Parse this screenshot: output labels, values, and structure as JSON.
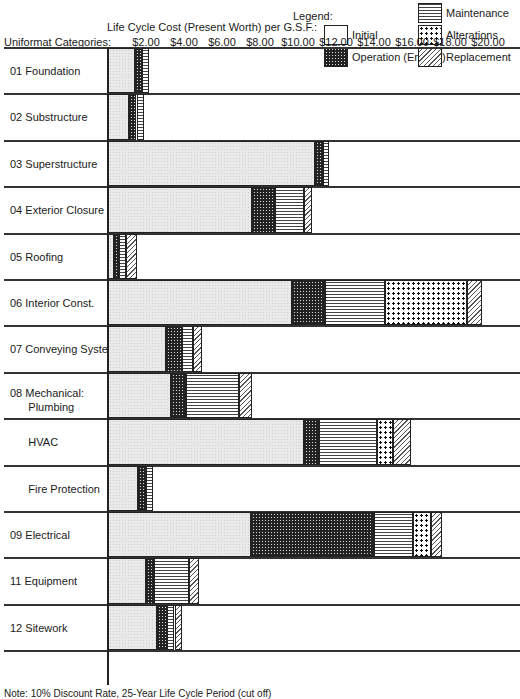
{
  "legend": {
    "title": "Legend:",
    "items": [
      {
        "key": "initial",
        "label": "Initial"
      },
      {
        "key": "operation",
        "label": "Operation (Energy)"
      },
      {
        "key": "maintenance",
        "label": "Maintenance"
      },
      {
        "key": "alterations",
        "label": "Alterations"
      },
      {
        "key": "replacement",
        "label": "Replacement"
      }
    ]
  },
  "axis": {
    "title": "Life Cycle Cost (Present Worth) per G.S.F.:",
    "category_header": "Uniformat Categories:",
    "ticks": [
      "$2.00",
      "$4.00",
      "$6.00",
      "$8.00",
      "$10.00",
      "$12.00",
      "$14.00",
      "$16.00",
      "$18.00",
      "$20.00"
    ]
  },
  "rows": [
    {
      "code": "01",
      "name": "Foundation"
    },
    {
      "code": "02",
      "name": "Substructure"
    },
    {
      "code": "03",
      "name": "Superstructure"
    },
    {
      "code": "04",
      "name": "Exterior Closure"
    },
    {
      "code": "05",
      "name": "Roofing"
    },
    {
      "code": "06",
      "name": "Interior Const."
    },
    {
      "code": "07",
      "name": "Conveying System"
    },
    {
      "code": "08",
      "name": "Mechanical:",
      "sub": "Plumbing"
    },
    {
      "code": "",
      "name": "HVAC"
    },
    {
      "code": "",
      "name": "Fire Protection"
    },
    {
      "code": "09",
      "name": "Electrical"
    },
    {
      "code": "11",
      "name": "Equipment"
    },
    {
      "code": "12",
      "name": "Sitework"
    }
  ],
  "footnote": "Note: 10% Discount Rate, 25-Year Life Cycle Period (cut off)",
  "chart_data": {
    "type": "bar",
    "orientation": "horizontal",
    "stacked": true,
    "title": "Life Cycle Cost (Present Worth) per G.S.F.",
    "xlabel": "Life Cycle Cost (Present Worth) per G.S.F.",
    "ylabel": "Uniformat Categories",
    "xlim": [
      0,
      20.5
    ],
    "x_ticks": [
      2,
      4,
      6,
      8,
      10,
      12,
      14,
      16,
      18,
      20
    ],
    "grid": false,
    "legend_position": "top-right",
    "categories": [
      "01 Foundation",
      "02 Substructure",
      "03 Superstructure",
      "04 Exterior Closure",
      "05 Roofing",
      "06 Interior Const.",
      "07 Conveying System",
      "08 Mechanical: Plumbing",
      "HVAC",
      "Fire Protection",
      "09 Electrical",
      "11 Equipment",
      "12 Sitework"
    ],
    "series": [
      {
        "name": "Initial",
        "values": [
          1.4,
          1.1,
          10.9,
          7.6,
          0.3,
          9.7,
          3.05,
          3.3,
          10.3,
          1.6,
          7.5,
          2.0,
          2.6
        ]
      },
      {
        "name": "Operation (Energy)",
        "values": [
          0.4,
          0.4,
          0.4,
          1.2,
          0.3,
          1.7,
          0.85,
          0.8,
          0.8,
          0.4,
          6.5,
          0.4,
          0.5
        ]
      },
      {
        "name": "Maintenance",
        "values": [
          0.35,
          0.4,
          0.35,
          1.5,
          0.35,
          3.2,
          0.55,
          2.8,
          3.05,
          0.35,
          2.05,
          1.85,
          0.4
        ]
      },
      {
        "name": "Alterations",
        "values": [
          0,
          0,
          0,
          0,
          0,
          4.3,
          0,
          0,
          0.85,
          0,
          0.95,
          0,
          0
        ]
      },
      {
        "name": "Replacement",
        "values": [
          0,
          0,
          0,
          0.45,
          0.6,
          0.8,
          0.5,
          0.7,
          0.95,
          0,
          0.6,
          0.55,
          0.4
        ]
      }
    ]
  }
}
